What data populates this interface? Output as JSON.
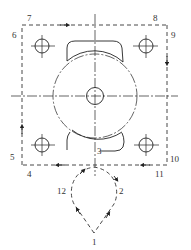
{
  "diagram": {
    "type": "toolpath-drawing",
    "labels": [
      {
        "id": "1",
        "text": "1"
      },
      {
        "id": "2",
        "text": "2"
      },
      {
        "id": "3",
        "text": "3"
      },
      {
        "id": "4",
        "text": "4"
      },
      {
        "id": "5",
        "text": "5"
      },
      {
        "id": "6",
        "text": "6"
      },
      {
        "id": "7",
        "text": "7"
      },
      {
        "id": "8",
        "text": "8"
      },
      {
        "id": "9",
        "text": "9"
      },
      {
        "id": "10",
        "text": "10"
      },
      {
        "id": "11",
        "text": "11"
      },
      {
        "id": "12",
        "text": "12"
      }
    ],
    "colors": {
      "line": "#222222",
      "background": "#ffffff"
    }
  }
}
